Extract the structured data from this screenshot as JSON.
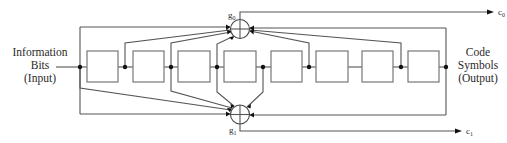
{
  "diagram": {
    "input_label": [
      "Information",
      "Bits",
      "(Input)"
    ],
    "output_label": [
      "Code",
      "Symbols",
      "(Output)"
    ],
    "adders": [
      {
        "id": "g0",
        "label": "g",
        "subscript": "0",
        "output": "c",
        "output_subscript": "0"
      },
      {
        "id": "g1",
        "label": "g",
        "subscript": "1",
        "output": "c",
        "output_subscript": "1"
      }
    ],
    "shift_register_count": 8,
    "g0_taps": [
      0,
      1,
      2,
      3,
      5,
      7,
      8
    ],
    "g1_taps": [
      0,
      2,
      3,
      4,
      8
    ],
    "colors": {
      "line": "#555555",
      "box_stroke": "#777777",
      "dot": "#111111",
      "text": "#2a2a2a"
    }
  }
}
